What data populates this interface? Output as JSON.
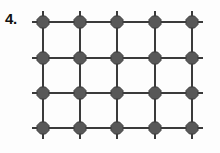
{
  "figure": {
    "label": "4.",
    "background_color": "#fdfdfd"
  },
  "diagram_data": {
    "type": "lattice-grid",
    "columns": 5,
    "rows": 4,
    "node_count": 20,
    "node_shape": "octagon",
    "node_fill": "#585858",
    "node_stroke": "#3d3d3d",
    "node_radius": 6.5,
    "edge_color": "#3a3a3a",
    "edge_width": 2,
    "stub_length": 11,
    "stubs": {
      "top": true,
      "bottom": true,
      "left": true,
      "right": true
    },
    "column_x": [
      43,
      80,
      117,
      155,
      192
    ],
    "row_y": [
      22,
      58,
      93,
      128
    ],
    "x_spacing": 37,
    "y_spacing": 35.3,
    "nodes": [
      {
        "id": "n-0-0",
        "row": 0,
        "col": 0,
        "x": 43,
        "y": 22
      },
      {
        "id": "n-0-1",
        "row": 0,
        "col": 1,
        "x": 80,
        "y": 22
      },
      {
        "id": "n-0-2",
        "row": 0,
        "col": 2,
        "x": 117,
        "y": 22
      },
      {
        "id": "n-0-3",
        "row": 0,
        "col": 3,
        "x": 155,
        "y": 22
      },
      {
        "id": "n-0-4",
        "row": 0,
        "col": 4,
        "x": 192,
        "y": 22
      },
      {
        "id": "n-1-0",
        "row": 1,
        "col": 0,
        "x": 43,
        "y": 58
      },
      {
        "id": "n-1-1",
        "row": 1,
        "col": 1,
        "x": 80,
        "y": 58
      },
      {
        "id": "n-1-2",
        "row": 1,
        "col": 2,
        "x": 117,
        "y": 58
      },
      {
        "id": "n-1-3",
        "row": 1,
        "col": 3,
        "x": 155,
        "y": 58
      },
      {
        "id": "n-1-4",
        "row": 1,
        "col": 4,
        "x": 192,
        "y": 58
      },
      {
        "id": "n-2-0",
        "row": 2,
        "col": 0,
        "x": 43,
        "y": 93
      },
      {
        "id": "n-2-1",
        "row": 2,
        "col": 1,
        "x": 80,
        "y": 93
      },
      {
        "id": "n-2-2",
        "row": 2,
        "col": 2,
        "x": 117,
        "y": 93
      },
      {
        "id": "n-2-3",
        "row": 2,
        "col": 3,
        "x": 155,
        "y": 93
      },
      {
        "id": "n-2-4",
        "row": 2,
        "col": 4,
        "x": 192,
        "y": 93
      },
      {
        "id": "n-3-0",
        "row": 3,
        "col": 0,
        "x": 43,
        "y": 128
      },
      {
        "id": "n-3-1",
        "row": 3,
        "col": 1,
        "x": 80,
        "y": 128
      },
      {
        "id": "n-3-2",
        "row": 3,
        "col": 2,
        "x": 117,
        "y": 128
      },
      {
        "id": "n-3-3",
        "row": 3,
        "col": 3,
        "x": 155,
        "y": 128
      },
      {
        "id": "n-3-4",
        "row": 3,
        "col": 4,
        "x": 192,
        "y": 128
      }
    ]
  }
}
